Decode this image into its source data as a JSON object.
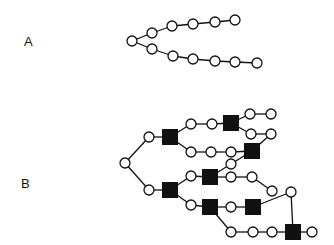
{
  "labels": {
    "a": "A",
    "b": "B"
  },
  "style": {
    "line_color": "#111111",
    "node_fill": "#ffffff",
    "square_fill": "#111111"
  },
  "diagram_a": {
    "circles": [
      [
        132,
        41
      ],
      [
        152,
        33
      ],
      [
        172,
        26
      ],
      [
        193,
        24
      ],
      [
        215,
        22
      ],
      [
        235,
        20
      ],
      [
        152,
        49
      ],
      [
        173,
        56
      ],
      [
        193,
        59
      ],
      [
        215,
        61
      ],
      [
        235,
        62
      ],
      [
        257,
        63
      ]
    ],
    "edges": [
      [
        0,
        1
      ],
      [
        1,
        2
      ],
      [
        2,
        3
      ],
      [
        3,
        4
      ],
      [
        4,
        5
      ],
      [
        0,
        6
      ],
      [
        6,
        7
      ],
      [
        7,
        8
      ],
      [
        8,
        9
      ],
      [
        9,
        10
      ],
      [
        10,
        11
      ]
    ]
  },
  "diagram_b": {
    "circles": [
      [
        125,
        163
      ],
      [
        149,
        137
      ],
      [
        149,
        190
      ],
      [
        191,
        124
      ],
      [
        212,
        124
      ],
      [
        250,
        114
      ],
      [
        271,
        114
      ],
      [
        251,
        134
      ],
      [
        271,
        134
      ],
      [
        191,
        152
      ],
      [
        211,
        152
      ],
      [
        231,
        152
      ],
      [
        191,
        176
      ],
      [
        231,
        164
      ],
      [
        231,
        177
      ],
      [
        252,
        177
      ],
      [
        272,
        191
      ],
      [
        191,
        205
      ],
      [
        231,
        207
      ],
      [
        291,
        192
      ],
      [
        231,
        232
      ],
      [
        253,
        232
      ],
      [
        272,
        232
      ],
      [
        312,
        232
      ]
    ],
    "squares": [
      [
        170,
        137
      ],
      [
        170,
        190
      ],
      [
        210,
        177
      ],
      [
        231,
        123
      ],
      [
        252,
        151
      ],
      [
        210,
        207
      ],
      [
        253,
        207
      ],
      [
        293,
        232
      ]
    ]
  }
}
